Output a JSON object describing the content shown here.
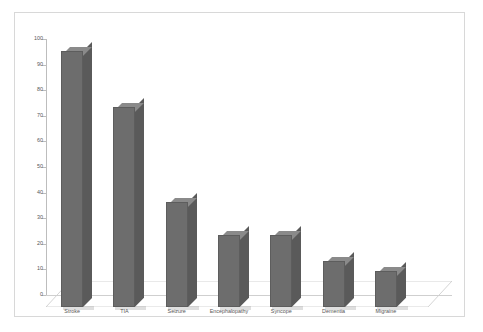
{
  "chart_data": {
    "type": "bar",
    "title": "",
    "subtitle": "",
    "xlabel": "",
    "ylabel": "",
    "categories": [
      "Stroke",
      "TIA",
      "Seizure",
      "Encephalopathy",
      "Syncope",
      "Dementia",
      "Migraine"
    ],
    "values": [
      100,
      78,
      41,
      28,
      28,
      18,
      14
    ],
    "ylim": [
      0,
      100
    ],
    "ytick_labels": [
      "0",
      "10",
      "20",
      "30",
      "40",
      "50",
      "60",
      "70",
      "80",
      "90",
      "100"
    ],
    "ytick_values": [
      0,
      10,
      20,
      30,
      40,
      50,
      60,
      70,
      80,
      90,
      100
    ],
    "grid": false,
    "legend": null,
    "legend_position": "none",
    "three_d": true,
    "annotations": []
  },
  "style": {
    "bar_front_color": "#6d6d6d",
    "bar_side_color": "#5a5a5a",
    "bar_top_color": "#8a8a8a",
    "axis_color": "#bdbdbd",
    "tick_label_color": "#575757",
    "frame_border_color": "#d8d8d8",
    "background_color": "#ffffff"
  }
}
